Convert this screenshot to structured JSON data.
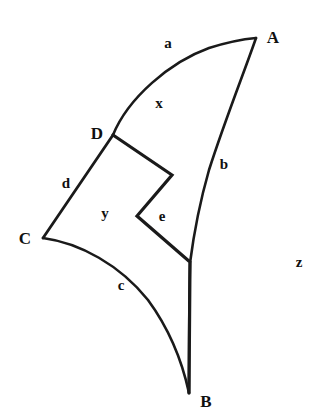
{
  "figure": {
    "background_color": "#ffffff",
    "stroke_color": "#1a1a1a",
    "canvas": {
      "width": 323,
      "height": 417
    },
    "vertices": [
      {
        "id": "A",
        "label": "A",
        "point_x": 256,
        "point_y": 38,
        "label_x": 273,
        "label_y": 37
      },
      {
        "id": "B",
        "label": "B",
        "point_x": 189,
        "point_y": 393,
        "label_x": 206,
        "label_y": 401
      },
      {
        "id": "C",
        "label": "C",
        "point_x": 43,
        "point_y": 238,
        "label_x": 25,
        "label_y": 238
      },
      {
        "id": "D",
        "label": "D",
        "point_x": 113,
        "point_y": 135,
        "label_x": 97,
        "label_y": 133
      }
    ],
    "edge_labels": [
      {
        "id": "a",
        "label": "a",
        "label_x": 168,
        "label_y": 43,
        "describes": "curve-D-to-A"
      },
      {
        "id": "b",
        "label": "b",
        "label_x": 224,
        "label_y": 164,
        "describes": "curve-A-to-B"
      },
      {
        "id": "c",
        "label": "c",
        "label_x": 121,
        "label_y": 285,
        "describes": "curve-C-to-B"
      },
      {
        "id": "d",
        "label": "d",
        "label_x": 66,
        "label_y": 183,
        "describes": "segment-D-to-C"
      }
    ],
    "region_labels": [
      {
        "id": "x",
        "label": "x",
        "label_x": 159,
        "label_y": 103
      },
      {
        "id": "y",
        "label": "y",
        "label_x": 105,
        "label_y": 213
      },
      {
        "id": "e",
        "label": "e",
        "label_x": 162,
        "label_y": 216
      },
      {
        "id": "z",
        "label": "z",
        "label_x": 299,
        "label_y": 262
      }
    ],
    "paths": {
      "curve_a_D_to_A": "M 113 135 C 128 98, 170 62, 209 48 C 228 42, 245 39, 256 38",
      "curve_b_A_to_B": "M 256 38 C 245 70, 225 120, 209 170 C 199 205, 193 240, 190 263 C 189 310, 189 360, 189 393",
      "curve_c_C_to_B": "M 43 238 C 80 243, 120 265, 148 300 C 170 330, 183 365, 189 393",
      "segment_d_D_to_C": "M 113 135 L 43 238",
      "zigzag_D_to_B_line": "M 113 135 L 172 175 L 137 216 L 190 262 L 189 393"
    },
    "stroke_widths": {
      "curve": 2.6,
      "zigzag": 3.2,
      "spine": 2.4
    }
  }
}
